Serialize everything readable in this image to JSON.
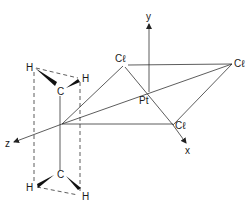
{
  "diagram": {
    "axes": {
      "x": "x",
      "y": "y",
      "z": "z"
    },
    "atoms": {
      "pt": "Pt",
      "cl_top": "Cℓ",
      "cl_right": "Cℓ",
      "cl_bottom": "Cℓ",
      "c_upper": "C",
      "c_lower": "C",
      "h_upper_left": "H",
      "h_upper_right": "H",
      "h_lower_left": "H",
      "h_lower_right": "H"
    },
    "colors": {
      "line": "#333333",
      "text": "#1a1a1a",
      "background": "#ffffff"
    }
  }
}
